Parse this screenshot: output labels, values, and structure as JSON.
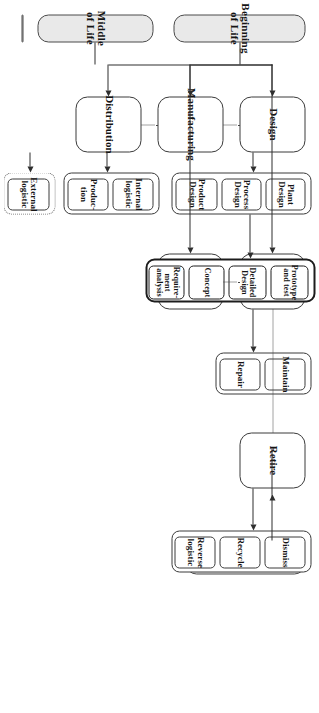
{
  "diagram": {
    "orientation": "rotated-90",
    "colors": {
      "phase_fill": "#e9e9e9",
      "node_fill": "#ffffff",
      "stroke": "#3a3a3a",
      "emphasis_stroke": "#1c1c1c",
      "dotted_stroke": "#6a6a6a"
    }
  },
  "phases": [
    {
      "id": "bol",
      "label": "Beginning of Life"
    },
    {
      "id": "mol",
      "label": "Middle of Life"
    },
    {
      "id": "eol",
      "label": "End of Life"
    }
  ],
  "stages": [
    {
      "id": "design",
      "label": "Design"
    },
    {
      "id": "manufacturing",
      "label": "Manufacturing"
    },
    {
      "id": "distribution",
      "label": "Distribution"
    },
    {
      "id": "use",
      "label": "Use"
    },
    {
      "id": "support",
      "label": "Support"
    },
    {
      "id": "retire",
      "label": "Retire"
    }
  ],
  "groups": [
    {
      "id": "design-activities",
      "parent": "design",
      "style": "solid",
      "items": [
        {
          "id": "product-design",
          "line1": "Product",
          "line2": "Design"
        },
        {
          "id": "process-design",
          "line1": "Process",
          "line2": "Design"
        },
        {
          "id": "plant-design",
          "line1": "Plant",
          "line2": "Design"
        }
      ]
    },
    {
      "id": "design-detail-activities",
      "parent": "process-design",
      "style": "heavy",
      "items": [
        {
          "id": "requirement-analysis",
          "line1": "Require-",
          "line2": "ment",
          "line3": "analysis"
        },
        {
          "id": "concept",
          "line1": "Concept",
          "line2": "",
          "line3": ""
        },
        {
          "id": "detailed-design",
          "line1": "Detailed",
          "line2": "Design",
          "line3": ""
        },
        {
          "id": "prototype-and-test",
          "line1": "Prototype",
          "line2": "and test",
          "line3": ""
        }
      ]
    },
    {
      "id": "manufacturing-activities",
      "parent": "manufacturing",
      "style": "solid",
      "items": [
        {
          "id": "production",
          "line1": "Produc-",
          "line2": "tion"
        },
        {
          "id": "internal-logistic",
          "line1": "Internal",
          "line2": "logistic"
        }
      ]
    },
    {
      "id": "distribution-activities",
      "parent": "distribution",
      "style": "dotted",
      "items": [
        {
          "id": "external-logistic",
          "line1": "External",
          "line2": "logistic"
        }
      ]
    },
    {
      "id": "support-activities",
      "parent": "support",
      "style": "solid",
      "items": [
        {
          "id": "repair",
          "line1": "Repair",
          "line2": ""
        },
        {
          "id": "maintain",
          "line1": "Maintain",
          "line2": ""
        }
      ]
    },
    {
      "id": "retire-activities",
      "parent": "retire",
      "style": "solid",
      "items": [
        {
          "id": "reverse-logistic",
          "line1": "Reverse",
          "line2": "logistic"
        },
        {
          "id": "recycle",
          "line1": "Recycle",
          "line2": ""
        },
        {
          "id": "dismiss",
          "line1": "Dismiss",
          "line2": ""
        }
      ]
    }
  ]
}
